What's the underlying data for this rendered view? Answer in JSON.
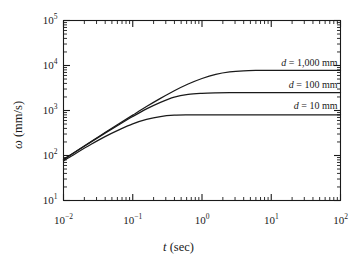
{
  "chart_data": {
    "type": "line",
    "title": "",
    "xlabel": "t (sec)",
    "xlabel_symbol": "t",
    "xlabel_unit": "(sec)",
    "ylabel": "ω (mm/s)",
    "ylabel_symbol": "ω",
    "ylabel_unit": "(mm/s)",
    "xscale": "log",
    "yscale": "log",
    "xlim": [
      0.01,
      100
    ],
    "ylim": [
      10,
      100000
    ],
    "grid": false,
    "legend_position": "inline-right",
    "line_color": "#1a1a1a",
    "axis_color": "#1a1a1a",
    "background_color": "#ffffff",
    "x_tick_labels": [
      "10⁻²",
      "10⁻¹",
      "10⁰",
      "10¹",
      "10²"
    ],
    "x_tick_values": [
      0.01,
      0.1,
      1,
      10,
      100
    ],
    "x_tick_mantissa": [
      "10",
      "10",
      "10",
      "10",
      "10"
    ],
    "x_tick_exponent": [
      "-2",
      "-1",
      "0",
      "1",
      "2"
    ],
    "y_tick_labels": [
      "10¹",
      "10²",
      "10³",
      "10⁴",
      "10⁵"
    ],
    "y_tick_values": [
      10,
      100,
      1000,
      10000,
      100000
    ],
    "y_tick_mantissa": [
      "10",
      "10",
      "10",
      "10",
      "10"
    ],
    "y_tick_exponent": [
      "1",
      "2",
      "3",
      "4",
      "5"
    ],
    "minor_ticks": true,
    "series": [
      {
        "name": "d = 1,000 mm",
        "label_symbol": "d",
        "label_rest": "= 1,000 mm",
        "d_mm": 1000,
        "plateau": 7800,
        "tau": 0.95,
        "x": [
          0.01,
          0.0158,
          0.0251,
          0.0398,
          0.0631,
          0.1,
          0.158,
          0.251,
          0.398,
          0.631,
          1.0,
          1.58,
          2.51,
          3.98,
          6.31,
          10,
          15.8,
          25.1,
          39.8,
          63.1,
          100
        ],
        "y": [
          82,
          129,
          205,
          323,
          507,
          790,
          1222,
          1858,
          2744,
          3872,
          5139,
          6337,
          7184,
          7618,
          7770,
          7798,
          7800,
          7800,
          7800,
          7800,
          7800
        ]
      },
      {
        "name": "d = 100 mm",
        "label_symbol": "d",
        "label_rest": "= 100 mm",
        "d_mm": 100,
        "plateau": 2500,
        "tau": 0.3,
        "x": [
          0.01,
          0.0158,
          0.0251,
          0.0398,
          0.0631,
          0.1,
          0.158,
          0.251,
          0.398,
          0.631,
          1.0,
          1.58,
          2.51,
          3.98,
          6.31,
          10,
          15.8,
          25.1,
          39.8,
          63.1,
          100
        ],
        "y": [
          81,
          128,
          201,
          314,
          484,
          736,
          1086,
          1521,
          1987,
          2280,
          2413,
          2470,
          2492,
          2498,
          2500,
          2500,
          2500,
          2500,
          2500,
          2500,
          2500
        ]
      },
      {
        "name": "d = 10 mm",
        "label_symbol": "d",
        "label_rest": "= 10 mm",
        "d_mm": 10,
        "plateau": 800,
        "tau": 0.1,
        "x": [
          0.01,
          0.0158,
          0.0251,
          0.0398,
          0.0631,
          0.1,
          0.158,
          0.251,
          0.398,
          0.631,
          1.0,
          1.58,
          2.51,
          3.98,
          6.31,
          10,
          15.8,
          25.1,
          39.8,
          63.1,
          100
        ],
        "y": [
          76,
          117,
          178,
          263,
          371,
          506,
          634,
          734,
          785,
          799,
          800,
          800,
          800,
          800,
          800,
          800,
          800,
          800,
          800,
          800,
          800
        ]
      }
    ],
    "annotations": [
      {
        "text": "d = 1,000 mm",
        "x": 12,
        "y": 11500
      },
      {
        "text": "d = 100 mm",
        "x": 12,
        "y": 3600
      },
      {
        "text": "d = 10 mm",
        "x": 12,
        "y": 1250
      }
    ]
  }
}
